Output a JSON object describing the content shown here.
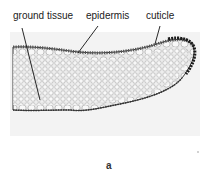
{
  "figure": {
    "labels": {
      "ground_tissue": "ground tissue",
      "epidermis": "epidermis",
      "cuticle": "cuticle"
    },
    "panel_letter": "a",
    "colors": {
      "background_tint": "#f2f2f2",
      "cell_fill": "#f7f7f7",
      "cell_wall": "#9a9a9a",
      "cuticle_edge": "#222222",
      "leader_line": "#111111"
    }
  }
}
